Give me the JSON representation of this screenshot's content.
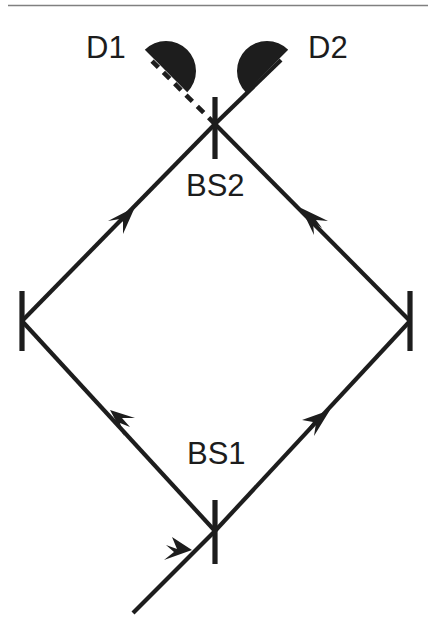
{
  "figure": {
    "background_color": "#ffffff",
    "ink_color": "#1d1d1d",
    "rule_color": "#808080",
    "width": 436,
    "height": 640
  },
  "labels": {
    "detector_1": "D1",
    "detector_2": "D2",
    "beamsplitter_1": "BS1",
    "beamsplitter_2": "BS2"
  },
  "components": {
    "beamsplitter_1": {
      "name": "BS1",
      "x": 215,
      "y": 531,
      "type": "beam-splitter",
      "orientation": "vertical-bar"
    },
    "beamsplitter_2": {
      "name": "BS2",
      "x": 215,
      "y": 124,
      "type": "beam-splitter",
      "orientation": "vertical-bar"
    },
    "mirror_left": {
      "name": "left mirror",
      "x": 22,
      "y": 321,
      "type": "mirror",
      "orientation": "vertical-bar"
    },
    "mirror_right": {
      "name": "right mirror",
      "x": 410,
      "y": 321,
      "type": "mirror",
      "orientation": "vertical-bar"
    },
    "detector_1": {
      "name": "D1",
      "x": 166,
      "y": 71,
      "type": "photodetector",
      "shape": "semicircle"
    },
    "detector_2": {
      "name": "D2",
      "x": 267,
      "y": 71,
      "type": "photodetector",
      "shape": "semicircle"
    }
  },
  "beams": [
    {
      "id": "input-beam",
      "from": "input",
      "to": "BS1",
      "style": "solid",
      "arrow": true
    },
    {
      "id": "lower-left-arm",
      "from": "BS1",
      "to": "left mirror",
      "style": "solid",
      "arrow": true
    },
    {
      "id": "upper-left-arm",
      "from": "left mirror",
      "to": "BS2",
      "style": "solid",
      "arrow": true
    },
    {
      "id": "lower-right-arm",
      "from": "BS1",
      "to": "right mirror",
      "style": "solid",
      "arrow": true
    },
    {
      "id": "upper-right-arm",
      "from": "right mirror",
      "to": "BS2",
      "style": "solid",
      "arrow": true
    },
    {
      "id": "output-beam-d1",
      "from": "BS2",
      "to": "D1",
      "style": "dashed",
      "arrow": false
    },
    {
      "id": "output-beam-d2",
      "from": "BS2",
      "to": "D2",
      "style": "solid",
      "arrow": false
    }
  ]
}
